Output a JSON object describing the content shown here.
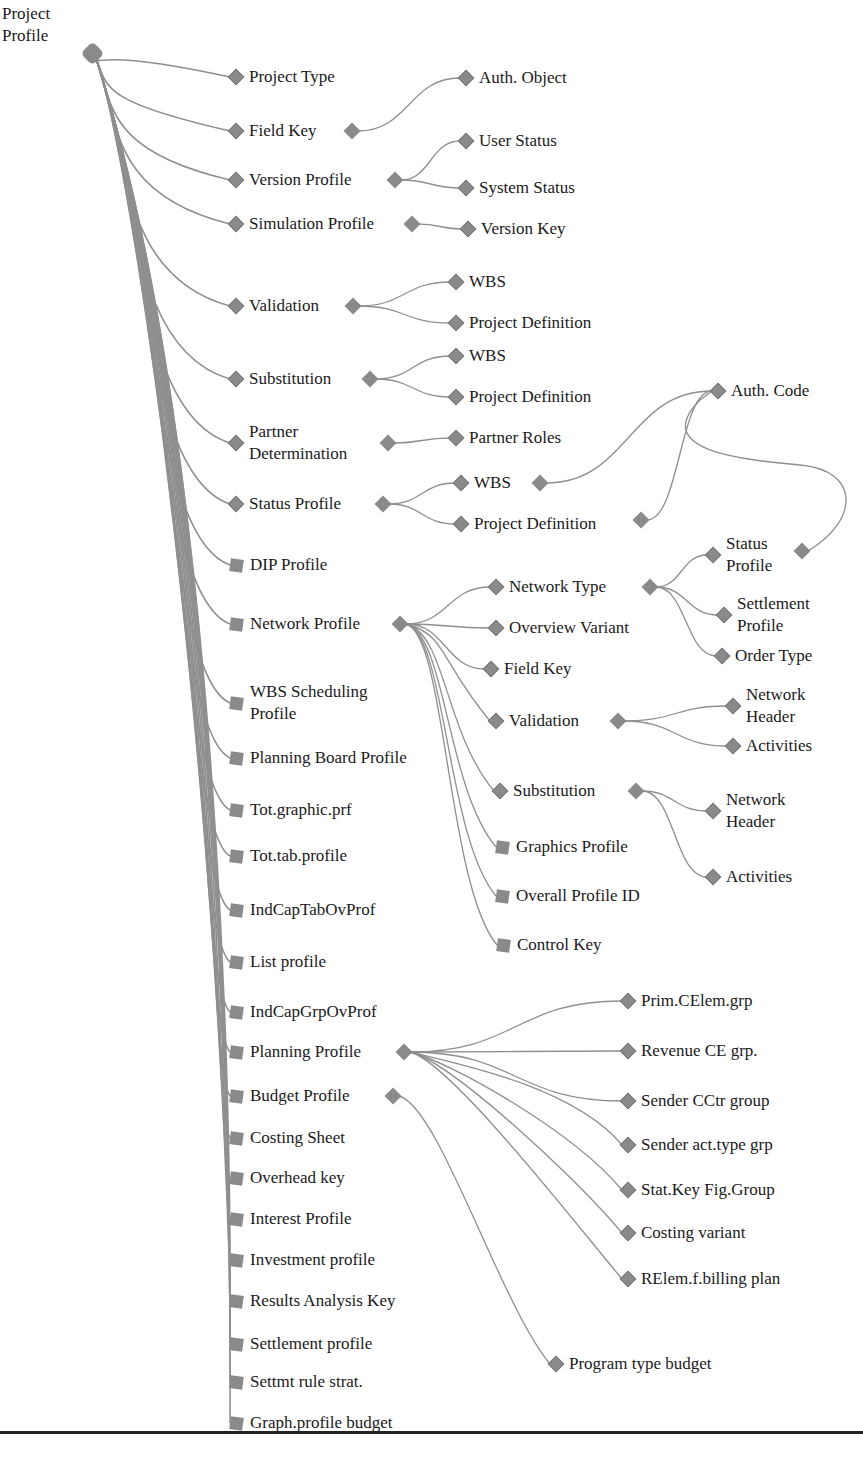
{
  "diagram": {
    "root": {
      "label": "Project\nProfile"
    },
    "colors": {
      "node": "#8a8a8a",
      "edge": "#8f8f8f",
      "text": "#1a1a1a",
      "rule": "#222222"
    },
    "level1": [
      {
        "label": "Project Type",
        "x": 236,
        "y": 77,
        "shape": "diamond"
      },
      {
        "label": "Field Key",
        "x": 236,
        "y": 131,
        "shape": "diamond",
        "tail_x": 352
      },
      {
        "label": "Version Profile",
        "x": 236,
        "y": 180,
        "shape": "diamond",
        "tail_x": 395
      },
      {
        "label": "Simulation Profile",
        "x": 236,
        "y": 224,
        "shape": "diamond",
        "tail_x": 412
      },
      {
        "label": "Validation",
        "x": 236,
        "y": 306,
        "shape": "diamond",
        "tail_x": 353
      },
      {
        "label": "Substitution",
        "x": 236,
        "y": 379,
        "shape": "diamond",
        "tail_x": 370
      },
      {
        "label": "Partner\nDetermination",
        "x": 236,
        "y": 443,
        "shape": "diamond",
        "tail_x": 388,
        "two": true
      },
      {
        "label": "Status Profile",
        "x": 236,
        "y": 504,
        "shape": "diamond",
        "tail_x": 383
      },
      {
        "label": "DIP Profile",
        "x": 236,
        "y": 565,
        "shape": "square"
      },
      {
        "label": "Network Profile",
        "x": 236,
        "y": 624,
        "shape": "square",
        "tail_x": 400
      },
      {
        "label": "WBS Scheduling\nProfile",
        "x": 236,
        "y": 703,
        "shape": "square",
        "two": true
      },
      {
        "label": "Planning Board Profile",
        "x": 236,
        "y": 758,
        "shape": "square"
      },
      {
        "label": "Tot.graphic.prf",
        "x": 236,
        "y": 810,
        "shape": "square"
      },
      {
        "label": "Tot.tab.profile",
        "x": 236,
        "y": 856,
        "shape": "square"
      },
      {
        "label": "IndCapTabOvProf",
        "x": 236,
        "y": 910,
        "shape": "square"
      },
      {
        "label": "List profile",
        "x": 236,
        "y": 962,
        "shape": "square"
      },
      {
        "label": "IndCapGrpOvProf",
        "x": 236,
        "y": 1012,
        "shape": "square"
      },
      {
        "label": "Planning Profile",
        "x": 236,
        "y": 1052,
        "shape": "square",
        "tail_x": 404
      },
      {
        "label": "Budget Profile",
        "x": 236,
        "y": 1096,
        "shape": "square",
        "tail_x": 393
      },
      {
        "label": "Costing Sheet",
        "x": 236,
        "y": 1138,
        "shape": "square"
      },
      {
        "label": "Overhead key",
        "x": 236,
        "y": 1178,
        "shape": "square"
      },
      {
        "label": "Interest Profile",
        "x": 236,
        "y": 1219,
        "shape": "square"
      },
      {
        "label": "Investment profile",
        "x": 236,
        "y": 1260,
        "shape": "square"
      },
      {
        "label": "Results Analysis Key",
        "x": 236,
        "y": 1301,
        "shape": "square"
      },
      {
        "label": "Settlement profile",
        "x": 236,
        "y": 1344,
        "shape": "square"
      },
      {
        "label": "Settmt rule strat.",
        "x": 236,
        "y": 1382,
        "shape": "square"
      },
      {
        "label": "Graph.profile budget",
        "x": 236,
        "y": 1423,
        "shape": "square"
      }
    ],
    "level2": [
      {
        "label": "Auth. Object",
        "x": 466,
        "y": 78,
        "from": 1
      },
      {
        "label": "User Status",
        "x": 466,
        "y": 141,
        "from": 2
      },
      {
        "label": "System Status",
        "x": 466,
        "y": 188,
        "from": 2
      },
      {
        "label": "Version Key",
        "x": 468,
        "y": 229,
        "from": 3
      },
      {
        "label": "WBS",
        "x": 456,
        "y": 282,
        "from": 4
      },
      {
        "label": "Project Definition",
        "x": 456,
        "y": 323,
        "from": 4
      },
      {
        "label": "WBS",
        "x": 456,
        "y": 356,
        "from": 5
      },
      {
        "label": "Project Definition",
        "x": 456,
        "y": 397,
        "from": 5
      },
      {
        "label": "Partner Roles",
        "x": 456,
        "y": 438,
        "from": 6
      },
      {
        "label": "WBS",
        "x": 461,
        "y": 483,
        "from": 7,
        "tail_x": 540
      },
      {
        "label": "Project Definition",
        "x": 461,
        "y": 524,
        "from": 7,
        "tail_x": 641,
        "tail_y": 520
      },
      {
        "label": "Network Type",
        "x": 496,
        "y": 587,
        "from": 9,
        "tail_x": 650
      },
      {
        "label": "Overview Variant",
        "x": 496,
        "y": 628,
        "from": 9
      },
      {
        "label": "Field Key",
        "x": 491,
        "y": 669,
        "from": 9
      },
      {
        "label": "Validation",
        "x": 496,
        "y": 721,
        "from": 9,
        "tail_x": 618
      },
      {
        "label": "Substitution",
        "x": 500,
        "y": 791,
        "from": 9,
        "tail_x": 636
      },
      {
        "label": "Graphics Profile",
        "x": 502,
        "y": 847,
        "from": 9,
        "shape": "square"
      },
      {
        "label": "Overall Profile ID",
        "x": 502,
        "y": 896,
        "from": 9,
        "shape": "square"
      },
      {
        "label": "Control Key",
        "x": 503,
        "y": 945,
        "from": 9,
        "shape": "square"
      },
      {
        "label": "Prim.CElem.grp",
        "x": 628,
        "y": 1001,
        "from": 17
      },
      {
        "label": "Revenue CE grp.",
        "x": 628,
        "y": 1051,
        "from": 17
      },
      {
        "label": "Sender CCtr group",
        "x": 628,
        "y": 1101,
        "from": 17
      },
      {
        "label": "Sender act.type grp",
        "x": 628,
        "y": 1145,
        "from": 17
      },
      {
        "label": "Stat.Key Fig.Group",
        "x": 628,
        "y": 1190,
        "from": 17
      },
      {
        "label": "Costing variant",
        "x": 628,
        "y": 1233,
        "from": 17
      },
      {
        "label": "RElem.f.billing plan",
        "x": 628,
        "y": 1279,
        "from": 17
      },
      {
        "label": "Program type budget",
        "x": 556,
        "y": 1364,
        "from": 18
      }
    ],
    "level3": [
      {
        "label": "Auth. Code",
        "x": 718,
        "y": 391
      },
      {
        "label": "Status\nProfile",
        "x": 713,
        "y": 555,
        "two": true,
        "tail_x": 802,
        "tail_y": 551
      },
      {
        "label": "Settlement\nProfile",
        "x": 724,
        "y": 615,
        "two": true
      },
      {
        "label": "Order Type",
        "x": 722,
        "y": 656
      },
      {
        "label": "Network\nHeader",
        "x": 733,
        "y": 706,
        "two": true
      },
      {
        "label": "Activities",
        "x": 733,
        "y": 746
      },
      {
        "label": "Network\nHeader",
        "x": 713,
        "y": 811,
        "two": true
      },
      {
        "label": "Activities",
        "x": 713,
        "y": 877
      }
    ]
  }
}
